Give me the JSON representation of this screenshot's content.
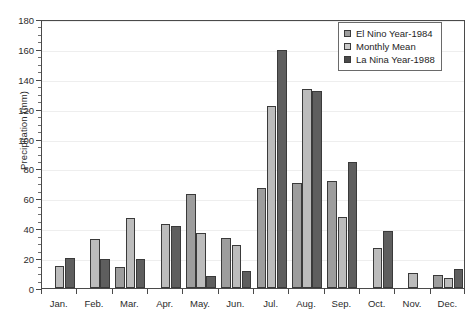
{
  "chart_data": {
    "type": "bar",
    "title": "",
    "xlabel": "",
    "ylabel": "Precipitation (mm)",
    "ylim": [
      0,
      180
    ],
    "ytick_step": 20,
    "yminor_step": 5,
    "grid": true,
    "legend_position": "top-right",
    "categories": [
      "Jan.",
      "Feb.",
      "Mar.",
      "Apr.",
      "May.",
      "Jun.",
      "Jul.",
      "Aug.",
      "Sep.",
      "Oct.",
      "Nov.",
      "Dec."
    ],
    "ytick_labels": [
      "0",
      "20",
      "40",
      "60",
      "80",
      "100",
      "120",
      "140",
      "160",
      "180"
    ],
    "series": [
      {
        "name": "El Nino Year-1984",
        "color": "#9d9d9d",
        "values": [
          0,
          0,
          14,
          0,
          63,
          33.5,
          67,
          70,
          71.5,
          0,
          0,
          9
        ]
      },
      {
        "name": "Monthly Mean",
        "color": "#c9c9c9",
        "values": [
          15,
          33,
          47,
          43,
          37,
          29,
          121.5,
          133,
          47.5,
          27,
          10,
          7
        ]
      },
      {
        "name": "La Nina Year-1988",
        "color": "#4a4a4a",
        "values": [
          20,
          19.5,
          19.5,
          41.5,
          8,
          11.5,
          159.5,
          132,
          84.5,
          38,
          0,
          12.5
        ]
      }
    ]
  },
  "legend": {
    "items": [
      {
        "label": "El Nino Year-1984"
      },
      {
        "label": "Monthly Mean"
      },
      {
        "label": "La Nina Year-1988"
      }
    ]
  }
}
